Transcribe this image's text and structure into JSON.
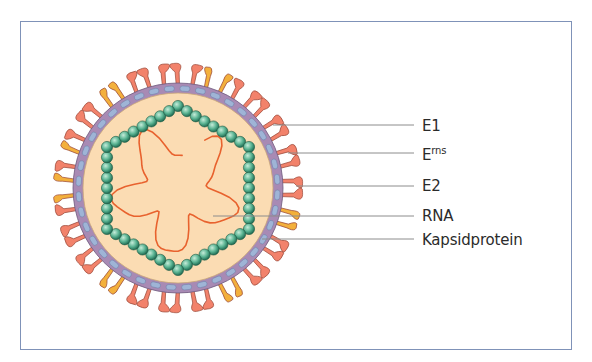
{
  "figure": {
    "type": "virion-structure",
    "frame": {
      "x": 20,
      "y": 21,
      "width": 552,
      "height": 329,
      "border_color": "#7f92b8"
    },
    "virion": {
      "center": [
        178,
        188
      ],
      "core_radius": 95,
      "envelope_inner_radius": 95,
      "envelope_outer_radius": 104,
      "spike_length": 20,
      "colors": {
        "core_fill": "#fbdcb3",
        "envelope_fill": "#a88ab4",
        "envelope_stroke": "#6e5a7e",
        "membrane_protein_fill": "#9fb4d6",
        "e1_e2_spike_fill": "#f2826b",
        "erns_spike_fill": "#f3b03c",
        "spike_stroke": "#9b4a3a",
        "capsid_bead_fill": "#3f9c7a",
        "capsid_bead_highlight": "#c5ecd9",
        "rna_stroke": "#e8622e",
        "leader_line": "#8c8c8c"
      },
      "capsid": {
        "shape": "hexagon",
        "radius": 82,
        "beads_per_side": 8,
        "bead_radius": 5.6
      },
      "erns_spike_angles_deg": [
        -72,
        -66,
        12,
        16,
        58,
        63,
        124,
        128,
        178,
        183,
        198,
        202,
        232,
        236
      ],
      "spike_count": 46
    },
    "labels": [
      {
        "id": "e1",
        "text": "E1",
        "sup": "",
        "line_y": 125,
        "line_x_start": 273,
        "text_top": 119
      },
      {
        "id": "erns",
        "text": "E",
        "sup": "rns",
        "line_y": 153,
        "line_x_start": 288,
        "text_top": 148
      },
      {
        "id": "e2",
        "text": "E2",
        "sup": "",
        "line_y": 186,
        "line_x_start": 296,
        "text_top": 179
      },
      {
        "id": "rna",
        "text": "RNA",
        "sup": "",
        "line_y": 216,
        "line_x_start": 213,
        "text_top": 209
      },
      {
        "id": "kapsid",
        "text": "Kapsidprotein",
        "sup": "",
        "line_y": 239,
        "line_x_start": 262,
        "text_top": 233
      }
    ],
    "line_x_end": 414,
    "label_x": 422
  }
}
